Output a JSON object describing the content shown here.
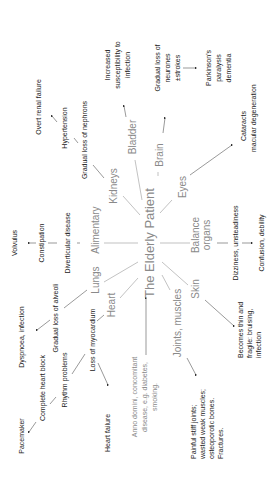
{
  "center": {
    "label": "The Elderly Patient"
  },
  "organs": {
    "kidneys": "Kidneys",
    "bladder": "Bladder",
    "brain": "Brain",
    "eyes": "Eyes",
    "balance_1": "Balance",
    "balance_2": "organs",
    "skin": "Skin",
    "joints": "Joints, muscles",
    "heart": "Heart",
    "lungs": "Lungs",
    "alimentary": "Alimentary"
  },
  "kidneys": {
    "step1": "Gradual loss of nephrons",
    "step2": "Hypertension",
    "step3": "Overt renal failure"
  },
  "bladder": {
    "line1": "Increased",
    "line2": "susceptibility to",
    "line3": "infection"
  },
  "brain": {
    "step1_line1": "Gradual loss of",
    "step1_line2": "neurones",
    "step1_line3": "±strokes",
    "step2_line1": "Parkinson's",
    "step2_line2": "paralysis",
    "step2_line3": "dementia"
  },
  "eyes": {
    "line1": "Cataracts",
    "line2": "macular degeneration"
  },
  "balance": {
    "step1": "Dizziness, unsteadiness",
    "step2": "Confusion, debility"
  },
  "skin": {
    "line1": "Becomes thin and",
    "line2": "fragile: bruising,",
    "line3": "infection"
  },
  "joints": {
    "line1": "Painful stiff joints;",
    "line2": "wasted weak muscles;",
    "line3": "osteoporotic bones.",
    "line4": "Fractures."
  },
  "causes": {
    "line1": "Anno domini, concomitant",
    "line2": "disease, e.g. diabetes,",
    "line3": "smoking."
  },
  "heart": {
    "step1": "Loss of myocardium",
    "rhythm": "Rhythm problems",
    "block": "Complete heart block",
    "pacemaker": "Pacemaker",
    "failure": "Heart failure"
  },
  "lungs": {
    "step1": "Gradual loss of alveoli",
    "step2": "Dyspnoea, infection"
  },
  "alimentary": {
    "step1": "Diverticular disease",
    "step2": "Constipation",
    "step3": "Volvulus"
  }
}
